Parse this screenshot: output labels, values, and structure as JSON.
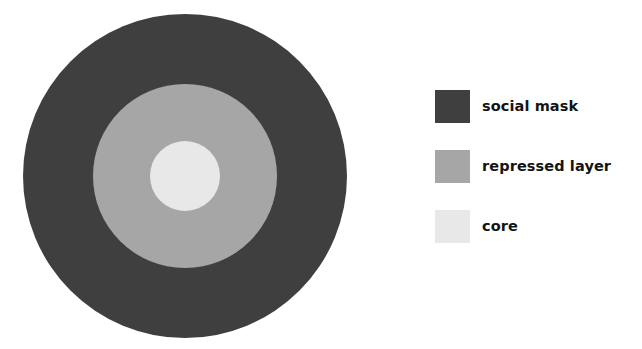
{
  "chart_data": {
    "type": "pie",
    "title": "",
    "subtitle": "",
    "xlabel": "",
    "ylabel": "",
    "grid": false,
    "legend_position": "right",
    "categories": [
      "social mask",
      "repressed layer",
      "core"
    ],
    "values": [
      324,
      184,
      70
    ],
    "value_unit": "diameter in pixels",
    "series": [
      {
        "name": "layer diameter",
        "values": [
          324,
          184,
          70
        ]
      }
    ],
    "layers": [
      {
        "label": "social mask",
        "color": "#3f3f3f",
        "diameter": 324,
        "radius": 162,
        "order": 1
      },
      {
        "label": "repressed layer",
        "color": "#a6a6a6",
        "diameter": 184,
        "radius": 92,
        "order": 2
      },
      {
        "label": "core",
        "color": "#e8e8e8",
        "diameter": 70,
        "radius": 35,
        "order": 3
      }
    ]
  },
  "diagram": {
    "name": "concentric-layers-diagram",
    "center_x": 185,
    "center_y": 176,
    "rings": [
      {
        "name": "social mask",
        "color": "#3f3f3f"
      },
      {
        "name": "repressed layer",
        "color": "#a6a6a6"
      },
      {
        "name": "core",
        "color": "#e8e8e8"
      }
    ]
  },
  "legend": {
    "items": [
      {
        "label": "social mask",
        "color": "#3f3f3f"
      },
      {
        "label": "repressed layer",
        "color": "#a6a6a6"
      },
      {
        "label": "core",
        "color": "#e8e8e8"
      }
    ]
  },
  "colors": {
    "background": "#ffffff",
    "text": "#141414",
    "social_mask": "#3f3f3f",
    "repressed_layer": "#a6a6a6",
    "core": "#e8e8e8"
  }
}
